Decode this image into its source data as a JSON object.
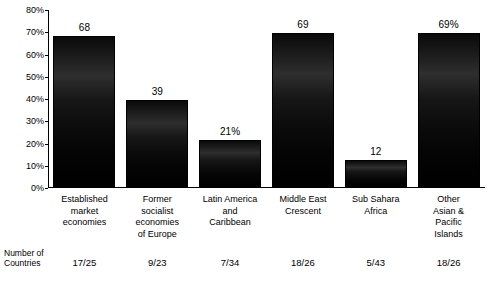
{
  "chart_data": {
    "type": "bar",
    "title": "",
    "xlabel": "",
    "ylabel": "",
    "ylim": [
      0,
      80
    ],
    "ytick_labels": [
      "0%",
      "10%",
      "20%",
      "30%",
      "40%",
      "50%",
      "60%",
      "70%",
      "80%"
    ],
    "ytick_values": [
      0,
      10,
      20,
      30,
      40,
      50,
      60,
      70,
      80
    ],
    "grid": false,
    "legend": "none",
    "categories": [
      "Established market economies",
      "Former socialist economies of Europe",
      "Latin America and Caribbean",
      "Middle East Crescent",
      "Sub Sahara Africa",
      "Other Asian & Pacific Islands"
    ],
    "category_lines": [
      [
        "Established",
        "market",
        "economies"
      ],
      [
        "Former",
        "socialist",
        "economies",
        "of Europe"
      ],
      [
        "Latin America",
        "and",
        "Caribbean"
      ],
      [
        "Middle East",
        "Crescent"
      ],
      [
        "Sub Sahara",
        "Africa"
      ],
      [
        "Other",
        "Asian &",
        "Pacific",
        "Islands"
      ]
    ],
    "values": [
      68,
      39,
      21,
      69,
      12,
      69
    ],
    "value_labels": [
      "68",
      "39",
      "21%",
      "69",
      "12",
      "69%"
    ],
    "footer_label_lines": [
      "Number of",
      "Countries"
    ],
    "footer_values": [
      "17/25",
      "9/23",
      "7/34",
      "18/26",
      "5/43",
      "18/26"
    ]
  }
}
